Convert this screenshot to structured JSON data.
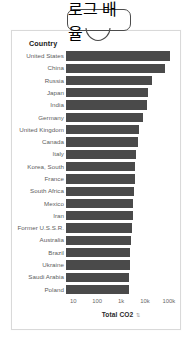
{
  "callout": {
    "label": "로그 배율",
    "tail_icon": "speech-bubble-tail"
  },
  "card": {
    "column_header": "Country"
  },
  "axis": {
    "title": "Total CO2",
    "sort_indicator_icon": "sort-descending-icon",
    "sort_indicator_glyph": "⇅"
  },
  "chart_data": {
    "type": "bar",
    "orientation": "horizontal",
    "title": "",
    "xlabel": "Total CO2",
    "ylabel": "Country",
    "xscale": "log",
    "grid": false,
    "legend": false,
    "xlim": [
      5,
      200000
    ],
    "xticks": [
      10,
      100,
      1000,
      10000,
      100000
    ],
    "xticklabels": [
      "10",
      "100",
      "1k",
      "10k",
      "100k"
    ],
    "categories": [
      "United States",
      "China",
      "Russia",
      "Japan",
      "India",
      "Germany",
      "United Kingdom",
      "Canada",
      "Italy",
      "Korea, South",
      "France",
      "South Africa",
      "Mexico",
      "Iran",
      "Former U.S.S.R.",
      "Australia",
      "Brazil",
      "Ukraine",
      "Saudi Arabia",
      "Poland"
    ],
    "values": [
      152000,
      122000,
      63000,
      51000,
      48000,
      36000,
      26000,
      24000,
      21000,
      20000,
      19000,
      18000,
      16500,
      16000,
      15000,
      13500,
      13000,
      12500,
      12000,
      11500
    ],
    "bar_pixel_widths": [
      104,
      99,
      86,
      82,
      81,
      77,
      73,
      72,
      70,
      69,
      69,
      68,
      67,
      67,
      66,
      65,
      64,
      64,
      63,
      63
    ]
  },
  "colors": {
    "bar": "#4a4a4a",
    "card_border": "#d9d9d9",
    "label_text": "#5d5d5d",
    "header_text": "#202020",
    "tick_text": "#6a6a6a",
    "callout_border": "#4c4c4c"
  }
}
